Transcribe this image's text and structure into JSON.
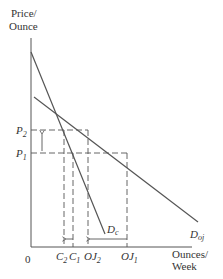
{
  "diagram": {
    "type": "supply-demand",
    "y_axis_label_line1": "Price/",
    "y_axis_label_line2": "Ounce",
    "x_axis_label_line1": "Ounces/",
    "x_axis_label_line2": "Week",
    "origin_label": "0",
    "price_labels": [
      {
        "main": "P",
        "sub": "2"
      },
      {
        "main": "P",
        "sub": "1"
      }
    ],
    "quantity_labels": [
      {
        "main": "C",
        "sub": "2"
      },
      {
        "main": "C",
        "sub": "1"
      },
      {
        "main": "OJ",
        "sub": "2"
      },
      {
        "main": "OJ",
        "sub": "1"
      }
    ],
    "curves": [
      {
        "name": "D",
        "sub": "c",
        "description": "steep demand curve (cocoa/complement)"
      },
      {
        "name": "D",
        "sub": "oj",
        "description": "flatter demand curve for orange juice"
      }
    ],
    "arrows": [
      {
        "description": "price rises from P1 to P2",
        "direction": "up"
      },
      {
        "description": "quantity falls from C1 to C2",
        "direction": "left"
      },
      {
        "description": "quantity falls from OJ1 to OJ2",
        "direction": "left"
      }
    ],
    "colors": {
      "line": "#555555",
      "dash": "#555555",
      "text": "#333333"
    }
  }
}
